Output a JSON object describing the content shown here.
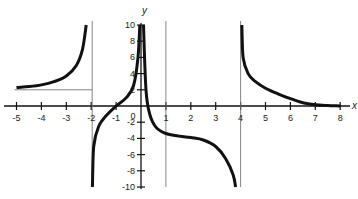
{
  "chart_data": {
    "type": "line",
    "title": "",
    "xlabel": "x",
    "ylabel": "y",
    "xlim": [
      -5.2,
      8.2
    ],
    "ylim": [
      -10,
      10
    ],
    "grid": false,
    "legend": null,
    "x_ticks": [
      -5,
      -4,
      -3,
      -2,
      -1,
      0,
      1,
      2,
      3,
      4,
      5,
      6,
      7,
      8
    ],
    "x_tick_labels": [
      "-5",
      "-4",
      "-3",
      "-2",
      "-1",
      "0",
      "1",
      "2",
      "3",
      "4",
      "5",
      "6",
      "7",
      "8"
    ],
    "y_ticks": [
      -10,
      -8,
      -6,
      -4,
      -2,
      2,
      4,
      6,
      8,
      10
    ],
    "y_tick_labels": [
      "-10",
      "-8",
      "-6",
      "-4",
      "-2",
      "2",
      "4",
      "6",
      "8",
      "10"
    ],
    "asymptotes": {
      "vertical": [
        -2,
        1,
        4
      ],
      "horizontal_segment": {
        "y": 2,
        "x_from": -5,
        "x_to": -2
      }
    },
    "series": [
      {
        "name": "branch-1 (x < -2)",
        "points": [
          [
            -5,
            2.3
          ],
          [
            -4.5,
            2.4
          ],
          [
            -4,
            2.6
          ],
          [
            -3.5,
            3.0
          ],
          [
            -3,
            3.7
          ],
          [
            -2.6,
            5.0
          ],
          [
            -2.35,
            7.0
          ],
          [
            -2.2,
            10
          ]
        ]
      },
      {
        "name": "branch-2 (-2 < x < 0)",
        "points": [
          [
            -1.95,
            -10
          ],
          [
            -1.9,
            -5
          ],
          [
            -1.7,
            -2.5
          ],
          [
            -1.4,
            -1.2
          ],
          [
            -1.0,
            0
          ],
          [
            -0.6,
            1.0
          ],
          [
            -0.3,
            2.5
          ],
          [
            -0.12,
            6
          ],
          [
            -0.05,
            10
          ]
        ]
      },
      {
        "name": "branch-3 (0 < x < 4)",
        "points": [
          [
            0.1,
            10
          ],
          [
            0.2,
            2
          ],
          [
            0.35,
            -1
          ],
          [
            0.6,
            -2.6
          ],
          [
            1,
            -3.4
          ],
          [
            1.5,
            -3.7
          ],
          [
            2,
            -3.9
          ],
          [
            2.5,
            -4.2
          ],
          [
            3,
            -5.0
          ],
          [
            3.4,
            -6.5
          ],
          [
            3.7,
            -8.5
          ],
          [
            3.8,
            -10
          ]
        ]
      },
      {
        "name": "branch-4 (x > 4)",
        "points": [
          [
            4.05,
            10
          ],
          [
            4.1,
            6
          ],
          [
            4.3,
            4
          ],
          [
            4.6,
            3.0
          ],
          [
            5,
            2.2
          ],
          [
            5.5,
            1.5
          ],
          [
            6,
            0.9
          ],
          [
            6.5,
            0.4
          ],
          [
            7,
            0.15
          ],
          [
            7.5,
            0.05
          ],
          [
            8,
            0
          ]
        ]
      }
    ]
  }
}
